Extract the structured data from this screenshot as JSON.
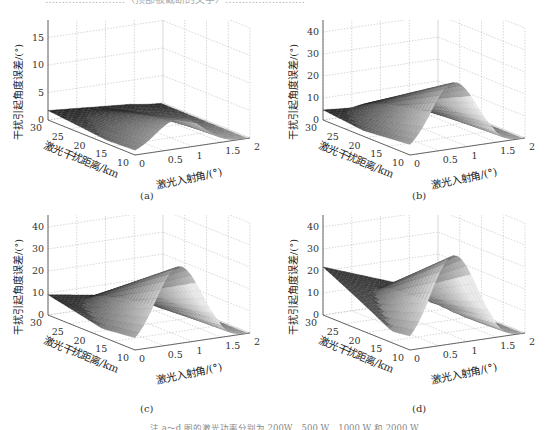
{
  "top_text_cut": "……………………（顶部被截断的文字）……………………",
  "note": "注  a～d 图的激光功率分别为 200W、500 W、1000 W 和 2000 W",
  "chart_data": [
    {
      "type": "surface3d",
      "panel": "a",
      "caption": "(a)",
      "zlabel": "干扰引起角度误差/(°)",
      "xlabel": "激光入射角/(°)",
      "ylabel": "激光干扰距离/km",
      "zlim": [
        0,
        20
      ],
      "zticks": [
        "0",
        "5",
        "10",
        "15",
        "20"
      ],
      "xticks": [
        "0",
        "0.5",
        "1",
        "1.5",
        "2"
      ],
      "yticks": [
        "10",
        "15",
        "20",
        "25",
        "30"
      ],
      "peak_value": 5.5,
      "edge_value_far": 1.5,
      "grid": true
    },
    {
      "type": "surface3d",
      "panel": "b",
      "caption": "(b)",
      "zlabel": "干扰引起角度误差/(°)",
      "xlabel": "激光入射角/(°)",
      "ylabel": "激光干扰距离/km",
      "zlim": [
        0,
        50
      ],
      "zticks": [
        "0",
        "10",
        "20",
        "30",
        "40",
        "50"
      ],
      "xticks": [
        "0",
        "0.5",
        "1",
        "1.5",
        "2"
      ],
      "yticks": [
        "10",
        "15",
        "20",
        "25",
        "30"
      ],
      "peak_value": 30,
      "edge_value_far": 4,
      "grid": true
    },
    {
      "type": "surface3d",
      "panel": "c",
      "caption": "(c)",
      "zlabel": "干扰引起角度误差/(°)",
      "xlabel": "激光入射角/(°)",
      "ylabel": "激光干扰距离/km",
      "zlim": [
        0,
        50
      ],
      "zticks": [
        "0",
        "10",
        "20",
        "30",
        "40",
        "50"
      ],
      "xticks": [
        "0",
        "0.5",
        "1",
        "1.5",
        "2"
      ],
      "yticks": [
        "10",
        "15",
        "20",
        "25",
        "30"
      ],
      "peak_value": 35,
      "edge_value_far": 8,
      "grid": true
    },
    {
      "type": "surface3d",
      "panel": "d",
      "caption": "(d)",
      "zlabel": "干扰引起角度误差/(°)",
      "xlabel": "激光入射角/(°)",
      "ylabel": "激光干扰距离/km",
      "zlim": [
        0,
        50
      ],
      "zticks": [
        "0",
        "10",
        "20",
        "30",
        "40",
        "50"
      ],
      "xticks": [
        "0",
        "0.5",
        "1",
        "1.5",
        "2"
      ],
      "yticks": [
        "10",
        "15",
        "20",
        "25",
        "30"
      ],
      "peak_value": 40,
      "edge_value_far": 19,
      "grid": true
    }
  ]
}
